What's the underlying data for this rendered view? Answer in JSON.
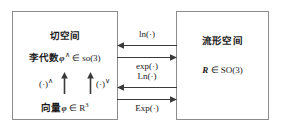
{
  "diagram": {
    "width": 281,
    "height": 129,
    "colors": {
      "background": "#ffffff",
      "border": "#8c8c8c",
      "text": "#1a1a1a",
      "arrow": "#3a3a3a"
    }
  },
  "tangent_space": {
    "title": "切空间",
    "lie_algebra": {
      "label": "李代数",
      "symbol": "φ",
      "superscript": "∧",
      "member": "∈",
      "set": "so(3)",
      "full": "李代数 φ∧ ∈ so(3)"
    },
    "vector": {
      "label": "向量",
      "symbol": "φ",
      "member": "∈",
      "set": "R",
      "set_superscript": "3",
      "full": "向量 φ ∈ R³"
    },
    "inner_maps": [
      {
        "name": "hat-map",
        "label": "(·)",
        "superscript": "∧",
        "direction": "up"
      },
      {
        "name": "vee-map",
        "label": "(·)",
        "superscript": "∨",
        "direction": "up"
      }
    ]
  },
  "manifold_space": {
    "title": "流形空间",
    "rotation": {
      "symbol": "R",
      "member": "∈",
      "set": "SO(3)",
      "full": "R ∈ SO(3)"
    }
  },
  "mappings": [
    {
      "name": "ln",
      "label": "ln(·)",
      "direction": "left",
      "label_position": "above"
    },
    {
      "name": "exp",
      "label": "exp(·)",
      "direction": "right",
      "label_position": "below"
    },
    {
      "name": "Ln",
      "label": "Ln(·)",
      "direction": "left",
      "label_position": "above"
    },
    {
      "name": "Exp",
      "label": "Exp(·)",
      "direction": "right",
      "label_position": "below"
    }
  ]
}
